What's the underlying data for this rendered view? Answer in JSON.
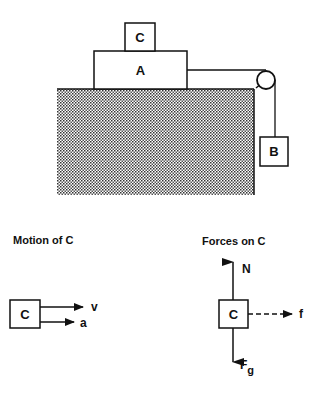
{
  "scene": {
    "block_top_label": "C",
    "block_bottom_label": "A",
    "hanging_block_label": "B"
  },
  "motion_panel": {
    "title": "Motion of C",
    "block_label": "C",
    "arrows": [
      {
        "label": "v",
        "style": "solid"
      },
      {
        "label": "a",
        "style": "solid"
      }
    ]
  },
  "forces_panel": {
    "title": "Forces on C",
    "block_label": "C",
    "forces": {
      "normal": {
        "label": "N",
        "direction": "up",
        "style": "solid"
      },
      "friction": {
        "label": "f",
        "direction": "right",
        "style": "dashed"
      },
      "gravity": {
        "label": "F",
        "subscript": "g",
        "direction": "down",
        "style": "solid"
      }
    }
  },
  "colors": {
    "ink": "#111111",
    "background": "#ffffff",
    "table_fill": "stippled"
  }
}
